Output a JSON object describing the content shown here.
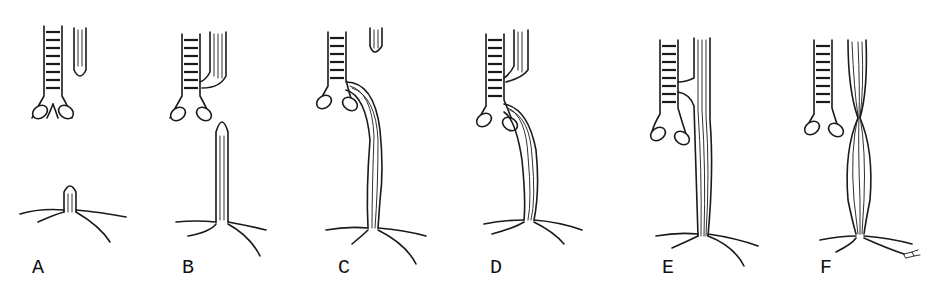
{
  "figure": {
    "type": "anatomical-line-drawing",
    "panel_count": 6,
    "ink_color": "#1a1a1a",
    "background_color": "#ffffff",
    "panels": [
      {
        "label": "A",
        "trachea_x": 42,
        "esophagus": "upper blind pouch; lower stub",
        "connection": "none"
      },
      {
        "label": "B",
        "trachea_x": 200,
        "esophagus": "upper pouch joins trachea; lower blind pouch",
        "connection": "upper-fistula"
      },
      {
        "label": "C",
        "trachea_x": 332,
        "esophagus": "upper blind pouch; lower segment arises from carina",
        "connection": "lower-fistula"
      },
      {
        "label": "D",
        "trachea_x": 490,
        "esophagus": "upper and lower both join trachea",
        "connection": "double-fistula"
      },
      {
        "label": "E",
        "trachea_x": 660,
        "esophagus": "continuous esophagus with H-type fistula",
        "connection": "h-type-fistula"
      },
      {
        "label": "F",
        "trachea_x": 830,
        "esophagus": "continuous with stenosis",
        "connection": "stenosis"
      }
    ]
  }
}
